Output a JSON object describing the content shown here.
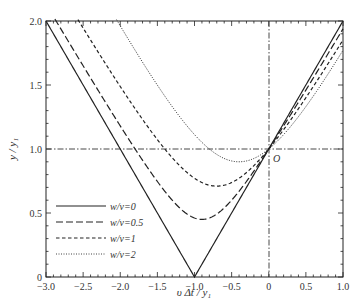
{
  "chart_data": {
    "type": "line",
    "title": "",
    "xlabel": "υ Δt / y₁",
    "ylabel": "y / y₁",
    "xlim": [
      -3.0,
      1.0
    ],
    "ylim": [
      0,
      2.0
    ],
    "x_ticks": [
      "-3.0",
      "-2.5",
      "-2.0",
      "-1.5",
      "-1.0",
      "-0.5",
      "0",
      "0.5",
      "1.0"
    ],
    "y_ticks": [
      "0",
      "0.5",
      "1.0",
      "1.5",
      "2.0"
    ],
    "grid": false,
    "reference_lines": {
      "horizontal_y": 1.0,
      "vertical_x": 0,
      "style": "dash-dot"
    },
    "annotations": [
      {
        "text": "O",
        "x": 0,
        "y": 1.0
      }
    ],
    "legend_position": "lower left",
    "series": [
      {
        "name": "w/v=0",
        "style": "solid",
        "minimum": {
          "x": -1.0,
          "y": 0.0
        },
        "x": [
          -3.0,
          -2.0,
          -1.0,
          0,
          1.0
        ],
        "y": [
          2.0,
          1.0,
          0.0,
          1.0,
          2.0
        ]
      },
      {
        "name": "w/v=0.5",
        "style": "long-dash",
        "minimum": {
          "x": -0.9,
          "y": 0.45
        },
        "x": [
          -2.5,
          -2.0,
          -1.5,
          -0.9,
          -0.5,
          0,
          0.5,
          1.0
        ],
        "y": [
          2.0,
          1.45,
          0.95,
          0.45,
          0.6,
          1.0,
          1.48,
          1.97
        ]
      },
      {
        "name": "w/v=1",
        "style": "short-dash",
        "minimum": {
          "x": -0.7,
          "y": 0.71
        },
        "x": [
          -1.65,
          -1.25,
          -1.0,
          -0.7,
          -0.4,
          0,
          0.5,
          1.0
        ],
        "y": [
          2.0,
          1.3,
          0.95,
          0.71,
          0.78,
          1.0,
          1.5,
          2.0
        ]
      },
      {
        "name": "w/v=2",
        "style": "dotted",
        "minimum": {
          "x": -0.4,
          "y": 0.9
        },
        "x": [
          -0.9,
          -0.7,
          -0.4,
          -0.2,
          0,
          0.5,
          0.78
        ],
        "y": [
          2.0,
          1.3,
          0.9,
          0.93,
          1.0,
          1.6,
          2.0
        ]
      }
    ]
  },
  "legend": {
    "items": [
      "w/v=0",
      "w/v=0.5",
      "w/v=1",
      "w/v=2"
    ]
  },
  "axes": {
    "xlabel": "υ Δt / y₁",
    "ylabel": "y / y₁",
    "origin_label": "O"
  }
}
